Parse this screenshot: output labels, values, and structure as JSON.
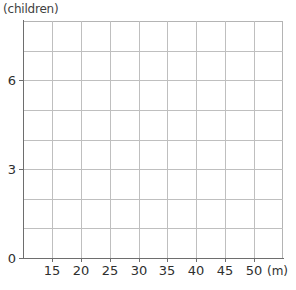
{
  "chart_data": {
    "type": "line",
    "title": "",
    "xlabel": "(m)",
    "ylabel": "(children)",
    "x_unit_label": "(m)",
    "y_unit_label": "(children)",
    "xlim": [
      10,
      55
    ],
    "ylim": [
      0,
      8
    ],
    "x_tick_labels": [
      "15",
      "20",
      "25",
      "30",
      "35",
      "40",
      "45",
      "50"
    ],
    "x_tick_values": [
      15,
      20,
      25,
      30,
      35,
      40,
      45,
      50
    ],
    "x_tick_step": 5,
    "y_tick_labels": [
      "0",
      "3",
      "6"
    ],
    "y_tick_values": [
      0,
      3,
      6
    ],
    "y_minor_step": 1,
    "grid": true,
    "grid_columns": 9,
    "grid_rows": 8,
    "legend": null,
    "series": [],
    "values": [],
    "annotations": [],
    "note": "empty plotting grid, no data plotted"
  },
  "colors": {
    "background": "#ffffff",
    "gridline": "#bfbfbf",
    "axis": "#6e6e6e",
    "text": "#2f2f2f",
    "caption": "#3f3f3f"
  }
}
